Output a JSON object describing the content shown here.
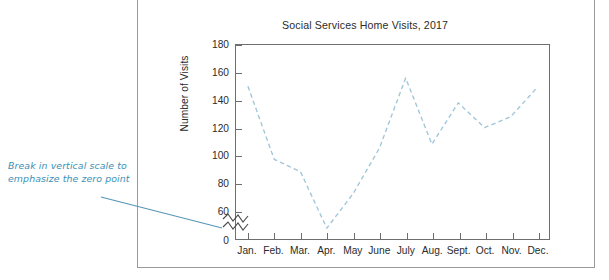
{
  "annotation": {
    "text": "Break in vertical scale to emphasize the zero point",
    "color": "#3b8fb5"
  },
  "figure": {
    "title": "Social Services Home Visits, 2017",
    "ylabel": "Number of Visits",
    "break_symbol_name": "axis-break-zigzag"
  },
  "chart_data": {
    "type": "line",
    "title": "Social Services Home Visits, 2017",
    "xlabel": "",
    "ylabel": "Number of Visits",
    "categories": [
      "Jan.",
      "Feb.",
      "Mar.",
      "Apr.",
      "May",
      "June",
      "July",
      "Aug.",
      "Sept.",
      "Oct.",
      "Nov.",
      "Dec."
    ],
    "values": [
      150,
      97,
      88,
      47,
      72,
      105,
      156,
      108,
      138,
      120,
      128,
      149
    ],
    "series": [
      {
        "name": "Number of Visits",
        "values": [
          150,
          97,
          88,
          47,
          72,
          105,
          156,
          108,
          138,
          120,
          128,
          149
        ]
      }
    ],
    "yticks": [
      60,
      80,
      100,
      120,
      140,
      160,
      180
    ],
    "ytick_labels": [
      "60",
      "80",
      "100",
      "120",
      "140",
      "160",
      "180"
    ],
    "zero_label": "0",
    "ylim": [
      47,
      180
    ],
    "axis_break": true,
    "axis_break_between": [
      0,
      60
    ],
    "grid": false,
    "legend": false,
    "line_style": "dashed",
    "line_color": "#9fc6d8"
  }
}
